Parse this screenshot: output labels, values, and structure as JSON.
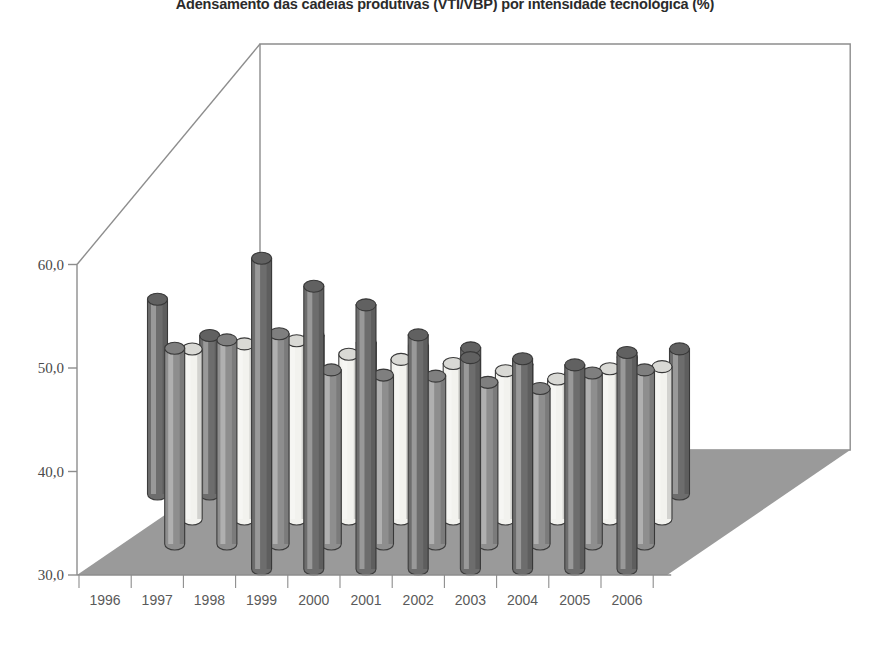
{
  "chart": {
    "title": "Adensamento das cadeias produtivas (VTI/VBP) por intensidade tecnológica (%)"
  },
  "chart_data": {
    "type": "bar",
    "title": "Adensamento das cadeias produtivas (VTI/VBP) por intensidade tecnológica (%)",
    "subtitle": "",
    "xlabel": "",
    "ylabel": "",
    "ylim": [
      30.0,
      62.0
    ],
    "yticks": [
      30.0,
      40.0,
      50.0,
      60.0
    ],
    "ytick_labels": [
      "30,0",
      "40,0",
      "50,0",
      "60,0"
    ],
    "grid": false,
    "legend": "none",
    "projection": "3d-cylinders",
    "categories": [
      "1996",
      "1997",
      "1998",
      "1999",
      "2000",
      "2001",
      "2002",
      "2003",
      "2004",
      "2005",
      "2006"
    ],
    "series": [
      {
        "name": "row-4-back",
        "color": "#6d6d6d",
        "values": [
          null,
          null,
          null,
          60.6,
          57.9,
          56.1,
          53.2,
          51.0,
          50.9,
          50.3,
          51.5
        ]
      },
      {
        "name": "row-3",
        "color": "#8e8e8e",
        "values": [
          null,
          49.5,
          50.3,
          50.9,
          47.4,
          46.9,
          46.8,
          46.2,
          45.6,
          47.1,
          47.4
        ]
      },
      {
        "name": "row-2",
        "color": "#f2f2ee",
        "values": [
          null,
          47.0,
          47.5,
          47.8,
          46.5,
          46.0,
          45.6,
          44.9,
          44.1,
          45.1,
          45.3
        ]
      },
      {
        "name": "row-1-front",
        "color": "#6d6d6d",
        "values": [
          49.4,
          45.9,
          45.9,
          45.9,
          45.2,
          44.9,
          44.7,
          43.1,
          42.3,
          43.8,
          44.6
        ]
      }
    ],
    "floor_color": "#9a9a9a",
    "wall_color": "#ffffff",
    "axis_color": "#8d8d8d"
  }
}
